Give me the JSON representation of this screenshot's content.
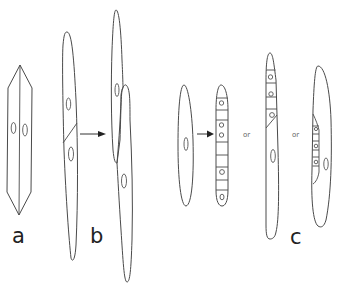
{
  "diagram": {
    "panels": [
      {
        "id": "a",
        "label": "a"
      },
      {
        "id": "b",
        "label": "b"
      },
      {
        "id": "c",
        "label": "c"
      }
    ],
    "connectors": {
      "or_1": "or",
      "or_2": "or"
    },
    "colors": {
      "stroke": "#4a4a4a",
      "background": "#ffffff"
    }
  }
}
